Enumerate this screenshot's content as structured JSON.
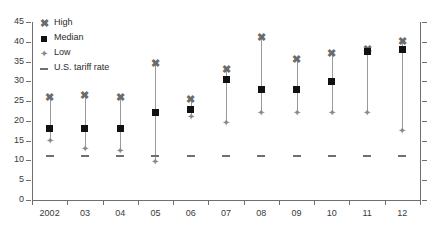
{
  "chart_data": {
    "type": "scatter",
    "title": "",
    "subtitle": "",
    "xlabel": "",
    "ylabel": "",
    "categories": [
      "2002",
      "03",
      "04",
      "05",
      "06",
      "07",
      "08",
      "09",
      "10",
      "11",
      "12"
    ],
    "xtick_labels": [
      "2002",
      "03",
      "04",
      "05",
      "06",
      "07",
      "08",
      "09",
      "10",
      "11",
      "12"
    ],
    "ytick_labels": [
      "0",
      "5",
      "10",
      "15",
      "20",
      "25",
      "30",
      "35",
      "40",
      "45"
    ],
    "yticks": [
      0,
      5,
      10,
      15,
      20,
      25,
      30,
      35,
      40,
      45
    ],
    "ylim": [
      0,
      45
    ],
    "grid": false,
    "legend_position": "top-left",
    "series": [
      {
        "name": "High",
        "marker": "x-cross",
        "color": "#6b6b6b",
        "values": [
          26,
          26.5,
          26,
          34.5,
          25.5,
          33,
          41,
          35.5,
          37,
          38,
          40
        ]
      },
      {
        "name": "Median",
        "marker": "square",
        "color": "#111111",
        "values": [
          18,
          18,
          18,
          22,
          23,
          30.5,
          28,
          28,
          30,
          37.5,
          38
        ]
      },
      {
        "name": "Low",
        "marker": "diamond",
        "color": "#8a8a8a",
        "values": [
          15,
          13,
          12.5,
          9.5,
          21,
          19.5,
          22,
          22,
          22,
          22,
          17.5
        ]
      },
      {
        "name": "U.S. tariff rate",
        "marker": "dash",
        "color": "#6f6f6f",
        "values": [
          11,
          11,
          11,
          11,
          11,
          11,
          11,
          11,
          11,
          11,
          11
        ]
      }
    ]
  },
  "legend": {
    "items": [
      {
        "label": "High",
        "glyph": "x-cross-icon"
      },
      {
        "label": "Median",
        "glyph": "square-icon"
      },
      {
        "label": "Low",
        "glyph": "diamond-icon"
      },
      {
        "label": "U.S. tariff rate",
        "glyph": "dash-icon"
      }
    ]
  }
}
